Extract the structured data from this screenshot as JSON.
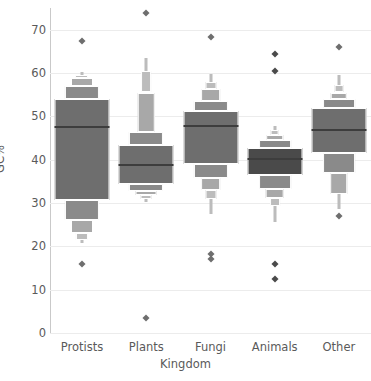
{
  "chart_data": {
    "type": "boxplot",
    "variant": "letter-value",
    "title": "",
    "xlabel": "Kingdom",
    "ylabel": "GC%",
    "categories": [
      "Protists",
      "Plants",
      "Fungi",
      "Animals",
      "Other"
    ],
    "ylim": [
      0,
      75
    ],
    "yticks": [
      0,
      10,
      20,
      30,
      40,
      50,
      60,
      70
    ],
    "grid": true,
    "legend": "none",
    "colors": {
      "box_dark": "#6e6e6e",
      "box_darkest": "#4a4a4a",
      "box_mid": "#8a8a8a",
      "box_light": "#a8a8a8",
      "box_lighter": "#bcbcbc",
      "median": "#3d3d3d",
      "grid": "#ececec",
      "text": "#5a5a5a"
    },
    "series": [
      {
        "name": "Protists",
        "median": 47.5,
        "boxes": [
          {
            "low": 30.8,
            "high": 54.0,
            "width": 1.0,
            "shade": "box_dark"
          },
          {
            "low": 54.0,
            "high": 57.0,
            "width": 0.62,
            "shade": "box_mid"
          },
          {
            "low": 57.0,
            "high": 58.8,
            "width": 0.4,
            "shade": "box_light"
          },
          {
            "low": 58.8,
            "high": 59.6,
            "width": 0.22,
            "shade": "box_lighter"
          },
          {
            "low": 26.0,
            "high": 30.8,
            "width": 0.62,
            "shade": "box_mid"
          },
          {
            "low": 23.0,
            "high": 26.0,
            "width": 0.4,
            "shade": "box_light"
          },
          {
            "low": 21.5,
            "high": 23.0,
            "width": 0.22,
            "shade": "box_lighter"
          }
        ],
        "whisker_high": 60.2,
        "whisker_low": 20.8,
        "outliers": [
          67.5,
          16.0
        ]
      },
      {
        "name": "Plants",
        "median": 38.8,
        "boxes": [
          {
            "low": 34.5,
            "high": 43.5,
            "width": 1.0,
            "shade": "box_dark"
          },
          {
            "low": 43.5,
            "high": 46.5,
            "width": 0.62,
            "shade": "box_mid"
          },
          {
            "low": 46.5,
            "high": 55.5,
            "width": 0.3,
            "shade": "box_light"
          },
          {
            "low": 55.5,
            "high": 60.5,
            "width": 0.18,
            "shade": "box_lighter"
          },
          {
            "low": 32.8,
            "high": 34.5,
            "width": 0.62,
            "shade": "box_mid"
          },
          {
            "low": 31.8,
            "high": 32.8,
            "width": 0.38,
            "shade": "box_light"
          },
          {
            "low": 31.0,
            "high": 31.8,
            "width": 0.2,
            "shade": "box_lighter"
          }
        ],
        "whisker_high": 63.5,
        "whisker_low": 30.2,
        "outliers": [
          73.8,
          3.5
        ]
      },
      {
        "name": "Fungi",
        "median": 47.8,
        "boxes": [
          {
            "low": 39.0,
            "high": 51.2,
            "width": 1.0,
            "shade": "box_dark"
          },
          {
            "low": 51.2,
            "high": 53.5,
            "width": 0.62,
            "shade": "box_mid"
          },
          {
            "low": 53.5,
            "high": 56.3,
            "width": 0.36,
            "shade": "box_light"
          },
          {
            "low": 56.3,
            "high": 58.0,
            "width": 0.2,
            "shade": "box_lighter"
          },
          {
            "low": 35.8,
            "high": 39.0,
            "width": 0.62,
            "shade": "box_mid"
          },
          {
            "low": 33.0,
            "high": 35.8,
            "width": 0.36,
            "shade": "box_light"
          },
          {
            "low": 31.0,
            "high": 33.0,
            "width": 0.2,
            "shade": "box_lighter"
          }
        ],
        "whisker_high": 59.8,
        "whisker_low": 27.5,
        "outliers": [
          68.2,
          18.2,
          17.0
        ]
      },
      {
        "name": "Animals",
        "median": 40.2,
        "boxes": [
          {
            "low": 36.5,
            "high": 42.8,
            "width": 1.0,
            "shade": "box_darkest"
          },
          {
            "low": 42.8,
            "high": 44.5,
            "width": 0.58,
            "shade": "box_mid"
          },
          {
            "low": 44.5,
            "high": 45.8,
            "width": 0.32,
            "shade": "box_light"
          },
          {
            "low": 45.8,
            "high": 46.8,
            "width": 0.16,
            "shade": "box_lighter"
          },
          {
            "low": 33.2,
            "high": 36.5,
            "width": 0.58,
            "shade": "box_mid"
          },
          {
            "low": 31.2,
            "high": 33.2,
            "width": 0.34,
            "shade": "box_light"
          },
          {
            "low": 29.2,
            "high": 31.2,
            "width": 0.18,
            "shade": "box_lighter"
          }
        ],
        "whisker_high": 47.8,
        "whisker_low": 25.5,
        "outliers": [
          64.5,
          60.5,
          16.0,
          12.5
        ]
      },
      {
        "name": "Other",
        "median": 46.8,
        "boxes": [
          {
            "low": 41.5,
            "high": 52.0,
            "width": 1.0,
            "shade": "box_dark"
          },
          {
            "low": 52.0,
            "high": 54.0,
            "width": 0.58,
            "shade": "box_mid"
          },
          {
            "low": 54.0,
            "high": 55.5,
            "width": 0.3,
            "shade": "box_light"
          },
          {
            "low": 55.5,
            "high": 57.2,
            "width": 0.16,
            "shade": "box_lighter"
          },
          {
            "low": 37.0,
            "high": 41.5,
            "width": 0.58,
            "shade": "box_mid"
          },
          {
            "low": 32.0,
            "high": 37.0,
            "width": 0.32,
            "shade": "box_light"
          }
        ],
        "whisker_high": 59.5,
        "whisker_low": 28.5,
        "outliers": [
          66.0,
          27.0
        ]
      }
    ]
  }
}
